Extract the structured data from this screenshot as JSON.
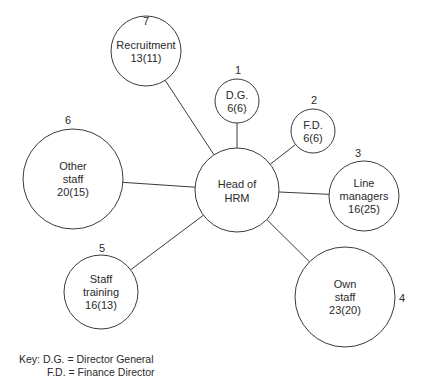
{
  "diagram": {
    "center": {
      "label_line1": "Head of",
      "label_line2": "HRM",
      "cx": 237,
      "cy": 190,
      "r": 42
    },
    "nodes": [
      {
        "number": "1",
        "line1": "D.G.",
        "line2": "6(6)",
        "line3": "",
        "cx": 237,
        "cy": 101,
        "r": 22,
        "nx": 238,
        "ny": 74
      },
      {
        "number": "2",
        "line1": "F.D.",
        "line2": "6(6)",
        "line3": "",
        "cx": 313,
        "cy": 131,
        "r": 22,
        "nx": 314,
        "ny": 104
      },
      {
        "number": "3",
        "line1": "Line",
        "line2": "managers",
        "line3": "16(25)",
        "cx": 364,
        "cy": 196,
        "r": 35,
        "nx": 358,
        "ny": 157
      },
      {
        "number": "4",
        "line1": "Own",
        "line2": "staff",
        "line3": "23(20)",
        "cx": 345,
        "cy": 297,
        "r": 50,
        "nx": 402,
        "ny": 302
      },
      {
        "number": "5",
        "line1": "Staff",
        "line2": "training",
        "line3": "16(13)",
        "cx": 101,
        "cy": 292,
        "r": 37,
        "nx": 102,
        "ny": 252
      },
      {
        "number": "6",
        "line1": "Other",
        "line2": "staff",
        "line3": "20(15)",
        "cx": 73,
        "cy": 179,
        "r": 50,
        "nx": 68,
        "ny": 124
      },
      {
        "number": "7",
        "line1": "Recruitment",
        "line2": "13(11)",
        "line3": "",
        "cx": 146,
        "cy": 51,
        "r": 35,
        "nx": 146,
        "ny": 25
      }
    ]
  },
  "key": {
    "title": "Key:",
    "entries": [
      {
        "abbr": "D.G.",
        "meaning": "= Director General"
      },
      {
        "abbr": "F.D.",
        "meaning": "= Finance Director"
      }
    ]
  }
}
